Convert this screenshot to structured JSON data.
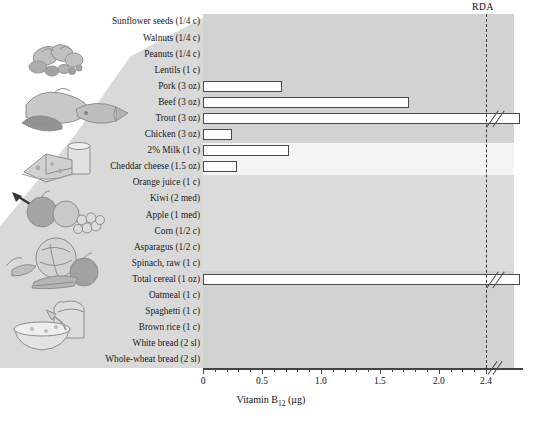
{
  "figure": {
    "rda_label": "RDA",
    "x_axis_title_main": "Vitamin B",
    "x_axis_title_sub": "12",
    "x_axis_title_unit": " (µg)"
  },
  "chart_data": {
    "type": "bar",
    "orientation": "horizontal",
    "title": "",
    "xlabel": "Vitamin B12 (µg)",
    "ylabel": "",
    "xlim": [
      0,
      2.4
    ],
    "grid": false,
    "legend": "none",
    "xticks": [
      0,
      0.5,
      1.0,
      1.5,
      2.0,
      2.4
    ],
    "xticklabels": [
      "0",
      "0.5",
      "1.0",
      "1.5",
      "2.0",
      "2.4"
    ],
    "minor_tick_interval": 0.1,
    "annotations": [
      {
        "name": "rda",
        "label": "RDA",
        "value": 2.4,
        "style": "dashed-vertical-line"
      }
    ],
    "categories": [
      "Sunflower seeds (1/4 c)",
      "Walnuts (1/4 c)",
      "Peanuts (1/4 c)",
      "Lentils (1 c)",
      "Pork (3 oz)",
      "Beef (3 oz)",
      "Trout (3 oz)",
      "Chicken (3 oz)",
      "2% Milk (1 c)",
      "Cheddar cheese (1.5 oz)",
      "Orange juice (1 c)",
      "Kiwi (2 med)",
      "Apple (1 med)",
      "Corn (1/2 c)",
      "Asparagus (1/2 c)",
      "Spinach, raw (1 c)",
      "Total cereal (1 oz)",
      "Oatmeal (1 c)",
      "Spaghetti (1 c)",
      "Brown rice (1 c)",
      "White bread (2 sl)",
      "Whole-wheat bread (2 sl)"
    ],
    "values": [
      0,
      0,
      0,
      0,
      0.67,
      1.75,
      2.6,
      0.25,
      0.73,
      0.29,
      0,
      0,
      0,
      0,
      0,
      0,
      2.6,
      0,
      0,
      0,
      0,
      0
    ],
    "broken_bars": [
      "Trout (3 oz)",
      "Total cereal (1 oz)"
    ],
    "groups": [
      {
        "name": "nuts-and-legumes",
        "members": [
          "Sunflower seeds (1/4 c)",
          "Walnuts (1/4 c)",
          "Peanuts (1/4 c)",
          "Lentils (1 c)"
        ]
      },
      {
        "name": "meat-and-fish",
        "members": [
          "Pork (3 oz)",
          "Beef (3 oz)",
          "Trout (3 oz)",
          "Chicken (3 oz)"
        ]
      },
      {
        "name": "dairy",
        "members": [
          "2% Milk (1 c)",
          "Cheddar cheese (1.5 oz)"
        ]
      },
      {
        "name": "fruits-and-vegetables",
        "members": [
          "Orange juice (1 c)",
          "Kiwi (2 med)",
          "Apple (1 med)",
          "Corn (1/2 c)",
          "Asparagus (1/2 c)",
          "Spinach, raw (1 c)"
        ]
      },
      {
        "name": "grains",
        "members": [
          "Total cereal (1 oz)",
          "Oatmeal (1 c)",
          "Spaghetti (1 c)",
          "Brown rice (1 c)",
          "White bread (2 sl)",
          "Whole-wheat bread (2 sl)"
        ]
      }
    ]
  },
  "colors": {
    "band_dark": "#d2d2d2",
    "band_light": "#f4f4f4",
    "band_mid": "#dcdcdc",
    "bar_fill": "#ffffff",
    "bar_stroke": "#4a4a4a",
    "axis": "#444444",
    "rda": "#3a3a3a",
    "wedge": "#d9d9d9"
  },
  "illustrations": [
    {
      "name": "nuts-illustration",
      "group": "nuts-and-legumes"
    },
    {
      "name": "meat-fish-illustration",
      "group": "meat-and-fish"
    },
    {
      "name": "dairy-illustration",
      "group": "dairy"
    },
    {
      "name": "fruit-illustration",
      "group": "fruits-and-vegetables"
    },
    {
      "name": "vegetable-illustration",
      "group": "fruits-and-vegetables"
    },
    {
      "name": "grains-illustration",
      "group": "grains"
    }
  ]
}
